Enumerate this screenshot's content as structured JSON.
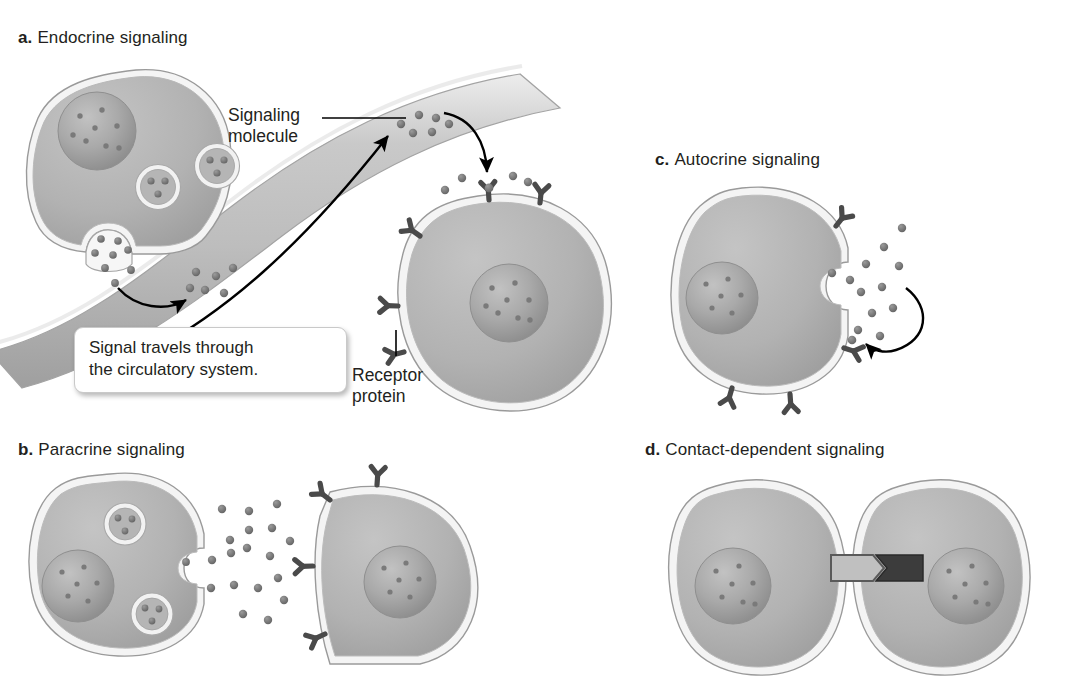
{
  "figure": {
    "top_cut_text": "",
    "background_color": "#ffffff",
    "ink_color": "#231f20",
    "cell_fill": "#b0b0b0",
    "cell_membrane": "#f2f2f2",
    "cell_outline": "#9a9a9a",
    "nucleus_fill": "#a5a5a5",
    "molecule_color": "#6e6e6e",
    "receptor_color": "#4a4a4a",
    "vessel_fill": "#c6c6c6",
    "ligand_light": "#c0c0c0",
    "receptor_dark": "#3c3c3c"
  },
  "panels": [
    {
      "key": "a",
      "letter": "a.",
      "title": "Endocrine signaling",
      "x": 18,
      "y": 28
    },
    {
      "key": "b",
      "letter": "b.",
      "title": "Paracrine signaling",
      "x": 18,
      "y": 440
    },
    {
      "key": "c",
      "letter": "c.",
      "title": "Autocrine signaling",
      "x": 655,
      "y": 150
    },
    {
      "key": "d",
      "letter": "d.",
      "title": "Contact-dependent signaling",
      "x": 645,
      "y": 440
    }
  ],
  "annotations": {
    "signaling_molecule": {
      "line1": "Signaling",
      "line2": "molecule",
      "x": 228,
      "y": 105
    },
    "receptor_protein": {
      "line1": "Receptor",
      "line2": "protein",
      "x": 352,
      "y": 365
    },
    "callout": {
      "line1": "Signal travels through",
      "line2": "the circulatory system.",
      "x": 74,
      "y": 327,
      "width": 244
    }
  },
  "structures": {
    "secreting_cell_label": "secreting cell",
    "target_cell_label": "target cell",
    "blood_vessel_label": "blood vessel",
    "vesicle_label": "secretory vesicle",
    "nucleus_label": "nucleus",
    "receptor_label": "receptor protein",
    "molecule_label": "signaling molecule",
    "ligand_label": "membrane-bound ligand",
    "junction_label": "contact junction"
  }
}
